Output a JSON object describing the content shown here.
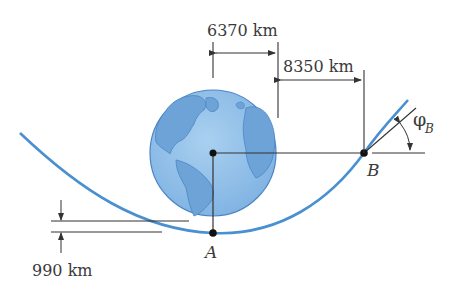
{
  "diagram": {
    "type": "orbital-trajectory",
    "colors": {
      "trajectory": "#4a8fd0",
      "earth_fill": "#8dbde8",
      "earth_land": "#6ea3d8",
      "earth_outline": "#4a86c4",
      "lines": "#333333"
    },
    "dimensions": {
      "earth_radius": "6370 km",
      "b_offset": "8350 km",
      "altitude_a": "990 km"
    },
    "points": {
      "a": "A",
      "b": "B"
    },
    "angle": {
      "symbol": "φ",
      "subscript": "B"
    }
  }
}
